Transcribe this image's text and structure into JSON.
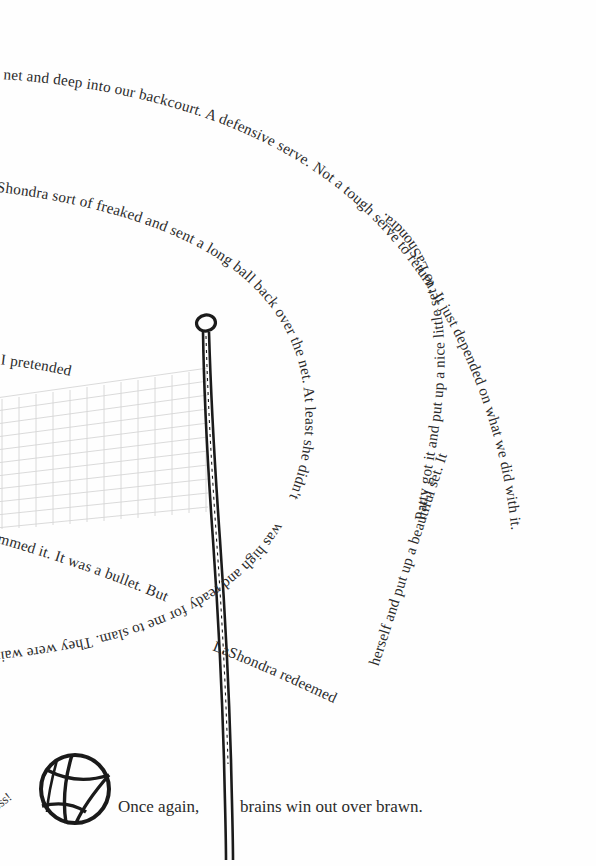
{
  "page": {
    "width": 596,
    "height": 866,
    "background": "#ffffff",
    "ink_color": "#2b2b2b",
    "net_color": "#d6d6d6",
    "pole_color": "#1b1b1b"
  },
  "spiral": {
    "description": "narrative text set on an inward clockwise spiral path",
    "segments": [
      {
        "id": "seg1",
        "text": "the net and deep into our backcourt. A defensive serve. Not a tough serve to return. It just depended on what we did with it."
      },
      {
        "id": "seg2",
        "text": "Patty got it and put up a nice little set to LaShondra."
      },
      {
        "id": "seg3",
        "text": "LaShondra sort of freaked and sent a long ball back over the net. At least she didn't"
      },
      {
        "id": "seg4",
        "text": "was high and ready for me to slam. They were waiting."
      },
      {
        "id": "seg5",
        "text": "So I pretended"
      },
      {
        "id": "seg6",
        "text": "slammed it. It was a bullet. But"
      },
      {
        "id": "seg7",
        "text": "LaShondra redeemed"
      },
      {
        "id": "seg8",
        "text": "herself and put up a beautiful set. It"
      }
    ],
    "full_text": "the net and deep into our backcourt. A defensive serve. Not a tough serve to return. It just depended on what we did with it. Patty got it and put up a nice little set to LaShondra. LaShondra sort of freaked and sent a long ball back over the net. At least she didn't slammed it. It was a bullet. But LaShondra redeemed herself and put up a beautiful set. It was high and ready for me to slam. They were waiting. So I pretended"
  },
  "footer": {
    "hiss": "ssssss!",
    "caption": "Once again, brains win out over brawn.",
    "caption_left": "Once again,",
    "caption_right": "brains win out over brawn."
  },
  "illustration": {
    "net_label": "volleyball-net",
    "pole_label": "net-pole",
    "ball_label": "volleyball"
  }
}
